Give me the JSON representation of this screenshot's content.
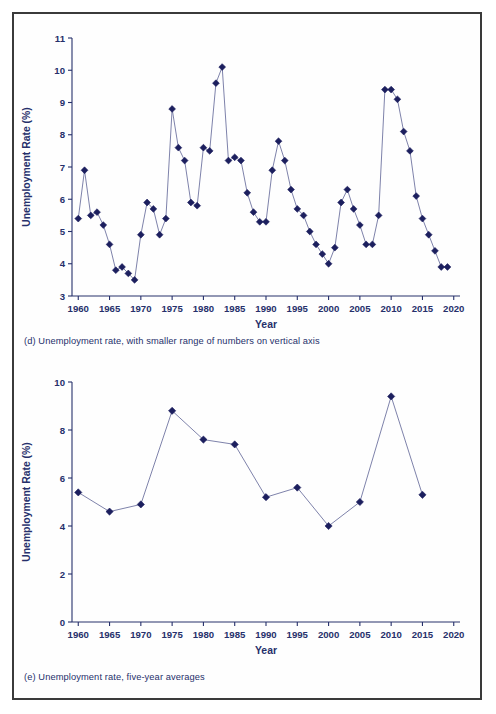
{
  "figure": {
    "background": "#ffffff",
    "frame_color": "#3a3a3a",
    "marker_color": "#1c1f5e",
    "line_color": "#6f74a0",
    "text_color": "#26306b"
  },
  "panels": [
    {
      "id": "d",
      "caption": "(d) Unemployment rate, with smaller range of numbers on vertical axis"
    },
    {
      "id": "e",
      "caption": "(e) Unemployment rate, five-year averages"
    }
  ],
  "chart_data": [
    {
      "type": "line",
      "panel": "d",
      "title": "",
      "xlabel": "Year",
      "ylabel": "Unemployment Rate (%)",
      "xlim": [
        1959,
        2021
      ],
      "ylim": [
        3,
        11
      ],
      "xticks": [
        1960,
        1965,
        1970,
        1975,
        1980,
        1985,
        1990,
        1995,
        2000,
        2005,
        2010,
        2015,
        2020
      ],
      "yticks": [
        3,
        4,
        5,
        6,
        7,
        8,
        9,
        10,
        11
      ],
      "xtick_labels": [
        "1960",
        "1965",
        "1970",
        "1975",
        "1980",
        "1985",
        "1990",
        "1995",
        "2000",
        "2005",
        "2010",
        "2015",
        "2020"
      ],
      "ytick_labels": [
        "3",
        "4",
        "5",
        "6",
        "7",
        "8",
        "9",
        "10",
        "11"
      ],
      "grid": false,
      "legend": null,
      "marker": "diamond",
      "x": [
        1960,
        1961,
        1962,
        1963,
        1964,
        1965,
        1966,
        1967,
        1968,
        1969,
        1970,
        1971,
        1972,
        1973,
        1974,
        1975,
        1976,
        1977,
        1978,
        1979,
        1980,
        1981,
        1982,
        1983,
        1984,
        1985,
        1986,
        1987,
        1988,
        1989,
        1990,
        1991,
        1992,
        1993,
        1994,
        1995,
        1996,
        1997,
        1998,
        1999,
        2000,
        2001,
        2002,
        2003,
        2004,
        2005,
        2006,
        2007,
        2008,
        2009,
        2010,
        2011,
        2012,
        2013,
        2014,
        2015,
        2016,
        2017,
        2018,
        2019
      ],
      "values": [
        5.4,
        6.9,
        5.5,
        5.6,
        5.2,
        4.6,
        3.8,
        3.9,
        3.7,
        3.5,
        4.9,
        5.9,
        5.7,
        4.9,
        5.4,
        8.8,
        7.6,
        7.2,
        5.9,
        5.8,
        7.6,
        7.5,
        9.6,
        10.1,
        7.2,
        7.3,
        7.2,
        6.2,
        5.6,
        5.3,
        5.3,
        6.9,
        7.8,
        7.2,
        6.3,
        5.7,
        5.5,
        5.0,
        4.6,
        4.3,
        4.0,
        4.5,
        5.9,
        6.3,
        5.7,
        5.2,
        4.6,
        4.6,
        5.5,
        9.4,
        9.4,
        9.1,
        8.1,
        7.5,
        6.1,
        5.4,
        4.9,
        4.4,
        3.9,
        3.9
      ]
    },
    {
      "type": "line",
      "panel": "e",
      "title": "",
      "xlabel": "Year",
      "ylabel": "Unemployment Rate (%)",
      "xlim": [
        1959,
        2021
      ],
      "ylim": [
        0,
        10
      ],
      "xticks": [
        1960,
        1965,
        1970,
        1975,
        1980,
        1985,
        1990,
        1995,
        2000,
        2005,
        2010,
        2015,
        2020
      ],
      "yticks": [
        0,
        2,
        4,
        6,
        8,
        10
      ],
      "xtick_labels": [
        "1960",
        "1965",
        "1970",
        "1975",
        "1980",
        "1985",
        "1990",
        "1995",
        "2000",
        "2005",
        "2010",
        "2015",
        "2020"
      ],
      "ytick_labels": [
        "0",
        "2",
        "4",
        "6",
        "8",
        "10"
      ],
      "grid": false,
      "legend": null,
      "marker": "diamond",
      "x": [
        1960,
        1965,
        1970,
        1975,
        1980,
        1985,
        1990,
        1995,
        2000,
        2005,
        2010,
        2015
      ],
      "values": [
        5.4,
        4.6,
        4.9,
        8.8,
        7.6,
        7.4,
        5.2,
        5.6,
        4.0,
        5.0,
        9.4,
        5.3
      ]
    }
  ]
}
